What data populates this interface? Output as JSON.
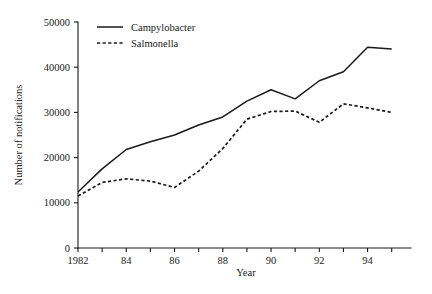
{
  "chart_data": {
    "type": "line",
    "title": "",
    "xlabel": "Year",
    "ylabel": "Number of notifications",
    "x": [
      1982,
      1983,
      1984,
      1985,
      1986,
      1987,
      1988,
      1989,
      1990,
      1991,
      1992,
      1993,
      1994,
      1995
    ],
    "xlim": [
      1982,
      1995.8
    ],
    "ylim": [
      0,
      50000
    ],
    "xticks": [
      1982,
      1983,
      1984,
      1985,
      1986,
      1987,
      1988,
      1989,
      1990,
      1991,
      1992,
      1993,
      1994,
      1995
    ],
    "xtick_labels": [
      "1982",
      "",
      "84",
      "",
      "86",
      "",
      "88",
      "",
      "90",
      "",
      "92",
      "",
      "94",
      ""
    ],
    "yticks": [
      0,
      10000,
      20000,
      30000,
      40000,
      50000
    ],
    "ytick_labels": [
      "0",
      "10000",
      "20000",
      "30000",
      "40000",
      "50000"
    ],
    "grid": false,
    "legend_position": "top-left-inside",
    "line_color": "#1a1a1a",
    "series": [
      {
        "name": "Campylobacter",
        "style": "solid",
        "values": [
          12400,
          17500,
          21800,
          23500,
          25000,
          27200,
          29000,
          32500,
          35000,
          33000,
          37000,
          39000,
          44400,
          44000
        ]
      },
      {
        "name": "Salmonella",
        "style": "dashed",
        "values": [
          11500,
          14500,
          15300,
          14800,
          13400,
          17000,
          22000,
          28500,
          30200,
          30300,
          27800,
          31900,
          31000,
          30000
        ]
      }
    ]
  },
  "legend": {
    "entries": [
      {
        "label": "Campylobacter",
        "style": "solid"
      },
      {
        "label": "Salmonella",
        "style": "dashed"
      }
    ]
  }
}
